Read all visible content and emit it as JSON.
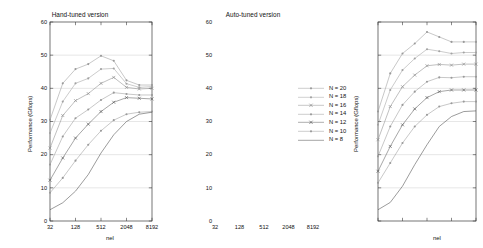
{
  "figure": {
    "width": 362,
    "height": 248,
    "background": "#ffffff"
  },
  "chart_data": {
    "type": "line",
    "panels": [
      {
        "name": "hand-tuned",
        "title": "Hand-tuned version",
        "xlabel": "nel",
        "ylabel": "Performance (Gflops)",
        "xscale": "log2",
        "xlim": [
          32,
          8192
        ],
        "ylim": [
          0,
          60
        ],
        "xticks": [
          32,
          128,
          512,
          2048,
          8192
        ],
        "xtick_labels": [
          "32",
          "128",
          "512",
          "2048",
          "8192"
        ],
        "yticks": [
          0,
          10,
          20,
          30,
          40,
          50,
          60
        ],
        "ytick_labels": [
          "0",
          "10",
          "20",
          "30",
          "40",
          "50",
          "60"
        ],
        "grid": true,
        "x": [
          32,
          64,
          128,
          256,
          512,
          1024,
          2048,
          4096,
          8192
        ],
        "series": [
          {
            "name": "N = 20",
            "marker": "dot",
            "color": "#9a9a9a",
            "values": [
              30.5,
              41.5,
              45.8,
              47.3,
              49.8,
              48.3,
              42.4,
              41.0,
              41.0
            ]
          },
          {
            "name": "N = 18",
            "marker": "dot",
            "color": "#a2a2a2",
            "values": [
              26.5,
              36.0,
              41.5,
              43.0,
              45.8,
              46.0,
              41.4,
              40.3,
              40.5
            ]
          },
          {
            "name": "N = 16",
            "marker": "cross",
            "color": "#8c8c8c",
            "values": [
              22.0,
              31.8,
              36.3,
              38.4,
              41.5,
              43.3,
              40.3,
              39.8,
              40.0
            ]
          },
          {
            "name": "N = 14",
            "marker": "dot",
            "color": "#9a9a9a",
            "values": [
              17.0,
              25.5,
              31.0,
              33.6,
              36.5,
              38.7,
              38.3,
              38.0,
              38.0
            ]
          },
          {
            "name": "N = 12",
            "marker": "cross",
            "color": "#5d5d5d",
            "values": [
              12.3,
              19.0,
              25.0,
              29.2,
              33.0,
              35.8,
              37.2,
              37.0,
              36.8
            ]
          },
          {
            "name": "N = 10",
            "marker": "dot",
            "color": "#9a9a9a",
            "values": [
              8.5,
              13.0,
              18.2,
              23.0,
              27.2,
              30.4,
              32.2,
              32.8,
              33.0
            ]
          },
          {
            "name": "N =  8",
            "marker": "line",
            "color": "#4a4a4a",
            "values": [
              3.4,
              5.5,
              9.0,
              14.0,
              20.5,
              26.0,
              30.0,
              32.2,
              32.8
            ]
          }
        ]
      },
      {
        "name": "auto-tuned",
        "title": "Auto-tuned version",
        "xlabel": "nel",
        "ylabel": "Performance (Gflops)",
        "xscale": "log2",
        "xlim": [
          32,
          8192
        ],
        "ylim": [
          0,
          60
        ],
        "xticks": [
          32,
          128,
          512,
          2048,
          8192
        ],
        "xtick_labels": [
          "32",
          "128",
          "512",
          "2048",
          "8192"
        ],
        "yticks": [
          0,
          10,
          20,
          30,
          40,
          50,
          60
        ],
        "ytick_labels": [
          "0",
          "10",
          "20",
          "30",
          "40",
          "50",
          "60"
        ],
        "grid": true,
        "x": [
          32,
          64,
          128,
          256,
          512,
          1024,
          2048,
          4096,
          8192
        ],
        "series": [
          {
            "name": "N = 20",
            "marker": "dot",
            "color": "#9a9a9a",
            "values": [
              33.0,
              44.5,
              50.5,
              53.5,
              57.0,
              55.5,
              54.0,
              54.0,
              54.0
            ]
          },
          {
            "name": "N = 18",
            "marker": "dot",
            "color": "#a2a2a2",
            "values": [
              29.0,
              39.5,
              45.5,
              49.0,
              51.8,
              51.2,
              50.5,
              50.8,
              50.8
            ]
          },
          {
            "name": "N = 16",
            "marker": "cross",
            "color": "#8c8c8c",
            "values": [
              24.5,
              34.5,
              40.5,
              44.0,
              46.8,
              47.2,
              47.0,
              47.3,
              47.3
            ]
          },
          {
            "name": "N = 14",
            "marker": "dot",
            "color": "#9a9a9a",
            "values": [
              19.5,
              28.5,
              35.0,
              39.0,
              42.0,
              43.3,
              43.2,
              43.5,
              43.5
            ]
          },
          {
            "name": "N = 12",
            "marker": "cross",
            "color": "#5d5d5d",
            "values": [
              15.0,
              22.5,
              29.0,
              33.8,
              37.2,
              39.0,
              39.5,
              39.5,
              39.5
            ]
          },
          {
            "name": "N = 10",
            "marker": "dot",
            "color": "#9a9a9a",
            "values": [
              11.5,
              17.5,
              23.5,
              28.5,
              32.0,
              34.5,
              35.5,
              36.0,
              36.0
            ]
          },
          {
            "name": "N =  8",
            "marker": "line",
            "color": "#4a4a4a",
            "values": [
              3.4,
              5.6,
              10.5,
              17.0,
              23.0,
              28.5,
              31.5,
              33.0,
              33.2
            ]
          }
        ]
      }
    ],
    "legend": {
      "position": "right",
      "entries": [
        {
          "label": "N = 20",
          "marker": "dot",
          "color": "#9a9a9a"
        },
        {
          "label": "N = 18",
          "marker": "dot",
          "color": "#a2a2a2"
        },
        {
          "label": "N = 16",
          "marker": "cross",
          "color": "#8c8c8c"
        },
        {
          "label": "N = 14",
          "marker": "dot",
          "color": "#9a9a9a"
        },
        {
          "label": "N = 12",
          "marker": "cross",
          "color": "#5d5d5d"
        },
        {
          "label": "N = 10",
          "marker": "dot",
          "color": "#9a9a9a"
        },
        {
          "label": "N =  8",
          "marker": "line",
          "color": "#4a4a4a"
        }
      ]
    }
  }
}
